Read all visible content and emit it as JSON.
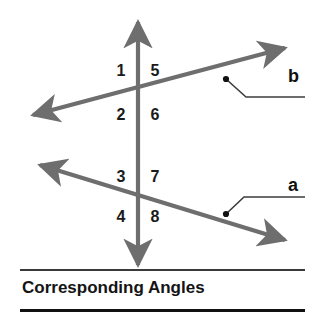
{
  "figure": {
    "caption": "Corresponding Angles",
    "stroke_color": "#6e6e6e",
    "text_color": "#141414",
    "background": "#ffffff"
  },
  "diagram": {
    "transversal": {
      "name": "vertical-transversal",
      "x1": 138,
      "y1": 22,
      "x2": 138,
      "y2": 265,
      "arrow_start": true,
      "arrow_end": true
    },
    "lines": [
      {
        "name": "line-b",
        "label": "b",
        "x1": 33,
        "y1": 115,
        "x2": 285,
        "y2": 48,
        "arrow_start": true,
        "arrow_end": true
      },
      {
        "name": "line-a",
        "label": "a",
        "x1": 40,
        "y1": 165,
        "x2": 285,
        "y2": 240,
        "arrow_start": true,
        "arrow_end": true
      }
    ],
    "intersections": [
      {
        "name": "upper-intersection",
        "x": 138,
        "y": 93
      },
      {
        "name": "lower-intersection",
        "x": 138,
        "y": 196
      }
    ],
    "angle_labels": [
      {
        "id": "1",
        "text": "1",
        "x": 113,
        "y": 63
      },
      {
        "id": "5",
        "text": "5",
        "x": 147,
        "y": 63
      },
      {
        "id": "2",
        "text": "2",
        "x": 113,
        "y": 107
      },
      {
        "id": "6",
        "text": "6",
        "x": 147,
        "y": 107
      },
      {
        "id": "3",
        "text": "3",
        "x": 113,
        "y": 169
      },
      {
        "id": "7",
        "text": "7",
        "x": 147,
        "y": 169
      },
      {
        "id": "4",
        "text": "4",
        "x": 113,
        "y": 209
      },
      {
        "id": "8",
        "text": "8",
        "x": 147,
        "y": 209
      }
    ],
    "leaders": [
      {
        "name": "leader-b",
        "label": "b",
        "dot_x": 226,
        "dot_y": 79,
        "elbow_x": 246,
        "elbow_y": 97,
        "end_x": 305,
        "end_y": 97,
        "label_x": 288,
        "label_y": 67
      },
      {
        "name": "leader-a",
        "label": "a",
        "dot_x": 226,
        "dot_y": 214,
        "elbow_x": 244,
        "elbow_y": 197,
        "end_x": 305,
        "end_y": 197,
        "label_x": 288,
        "label_y": 176
      }
    ]
  }
}
